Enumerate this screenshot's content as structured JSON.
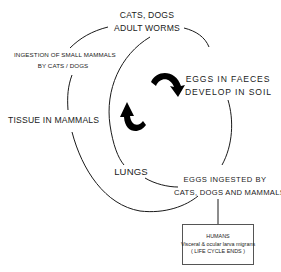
{
  "diagram": {
    "type": "life-cycle",
    "nodes": {
      "adult_worms": {
        "line1": "CATS, DOGS",
        "line2": "ADULT WORMS"
      },
      "eggs_faeces": {
        "line1": "EGGS IN FAECES",
        "line2": "DEVELOP IN SOIL"
      },
      "eggs_ingested": {
        "line1": "EGGS INGESTED BY",
        "line2": "CATS, DOGS AND MAMMALS"
      },
      "lungs": {
        "label": "LUNGS"
      },
      "tissue": {
        "label": "TISSUE IN MAMMALS"
      },
      "ingestion": {
        "line1": "INGESTION OF SMALL MAMMALS",
        "line2": "BY CATS / DOGS"
      },
      "humans": {
        "line1": "HUMANS",
        "line2": "Visceral & ocular larva migrans",
        "line3": "( LIFE CYCLE ENDS )"
      }
    },
    "arrows": [
      {
        "name": "clockwise-arrow",
        "direction": "clockwise"
      },
      {
        "name": "counterclockwise-arrow",
        "direction": "up"
      }
    ],
    "colors": {
      "line": "#1a1a1a",
      "background": "#ffffff"
    }
  }
}
